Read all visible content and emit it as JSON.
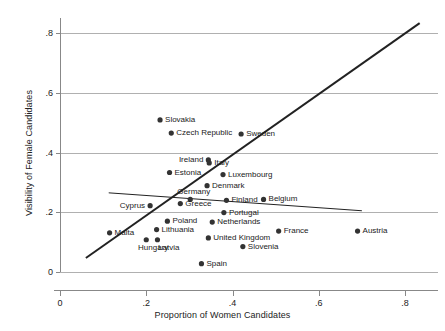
{
  "chart_data": {
    "type": "scatter",
    "title": "",
    "xlabel": "Proportion of Women Candidates",
    "ylabel": "Visibility of Female Candidates",
    "xlim": [
      0.0,
      0.87
    ],
    "ylim": [
      0.0,
      0.86
    ],
    "grid": "horizontal",
    "legend": "none",
    "xticks": [
      0,
      0.2,
      0.4,
      0.6,
      0.8
    ],
    "xticklabels": [
      "0",
      ".2",
      ".4",
      ".6",
      ".8"
    ],
    "yticks": [
      0,
      0.2,
      0.4,
      0.6,
      0.8
    ],
    "yticklabels": [
      "0",
      ".2",
      ".4",
      ".6",
      ".8"
    ],
    "marker_color": "#333333",
    "line_color": "#222222",
    "grid_color": "#b0b0b0",
    "points": [
      {
        "label": "Slovakia",
        "x": 0.232,
        "y": 0.509,
        "label_side": "right"
      },
      {
        "label": "Czech Republic",
        "x": 0.258,
        "y": 0.465,
        "label_side": "right"
      },
      {
        "label": "Sweden",
        "x": 0.42,
        "y": 0.462,
        "label_side": "right"
      },
      {
        "label": "Ireland",
        "x": 0.344,
        "y": 0.375,
        "label_side": "left"
      },
      {
        "label": "Italy",
        "x": 0.346,
        "y": 0.365,
        "label_side": "right"
      },
      {
        "label": "Estonia",
        "x": 0.254,
        "y": 0.333,
        "label_side": "right"
      },
      {
        "label": "Luxembourg",
        "x": 0.378,
        "y": 0.326,
        "label_side": "right"
      },
      {
        "label": "Denmark",
        "x": 0.341,
        "y": 0.289,
        "label_side": "right"
      },
      {
        "label": "Germany",
        "x": 0.302,
        "y": 0.243,
        "label_side": "above"
      },
      {
        "label": "Finland",
        "x": 0.386,
        "y": 0.24,
        "label_side": "right"
      },
      {
        "label": "Belgium",
        "x": 0.472,
        "y": 0.243,
        "label_side": "right"
      },
      {
        "label": "Greece",
        "x": 0.279,
        "y": 0.229,
        "label_side": "right"
      },
      {
        "label": "Cyprus",
        "x": 0.209,
        "y": 0.222,
        "label_side": "left"
      },
      {
        "label": "Portugal",
        "x": 0.38,
        "y": 0.199,
        "label_side": "right"
      },
      {
        "label": "Poland",
        "x": 0.249,
        "y": 0.17,
        "label_side": "right"
      },
      {
        "label": "Netherlands",
        "x": 0.353,
        "y": 0.167,
        "label_side": "right"
      },
      {
        "label": "Lithuania",
        "x": 0.224,
        "y": 0.142,
        "label_side": "right"
      },
      {
        "label": "United Kingdom",
        "x": 0.344,
        "y": 0.114,
        "label_side": "right"
      },
      {
        "label": "France",
        "x": 0.507,
        "y": 0.137,
        "label_side": "right"
      },
      {
        "label": "Austria",
        "x": 0.69,
        "y": 0.137,
        "label_side": "right"
      },
      {
        "label": "Latvia",
        "x": 0.226,
        "y": 0.108,
        "label_side": "below"
      },
      {
        "label": "Hungary",
        "x": 0.2,
        "y": 0.108,
        "label_side": "below"
      },
      {
        "label": "Malta",
        "x": 0.115,
        "y": 0.131,
        "label_side": "right"
      },
      {
        "label": "Slovenia",
        "x": 0.424,
        "y": 0.085,
        "label_side": "right"
      },
      {
        "label": "Spain",
        "x": 0.328,
        "y": 0.028,
        "label_side": "right"
      }
    ],
    "lines": [
      {
        "name": "steep-fit-line",
        "x0": 0.06,
        "y0": 0.047,
        "x1": 0.834,
        "y1": 0.833,
        "width": 2.0
      },
      {
        "name": "shallow-fit-line",
        "x0": 0.113,
        "y0": 0.265,
        "x1": 0.7,
        "y1": 0.205,
        "width": 1.0
      }
    ]
  }
}
